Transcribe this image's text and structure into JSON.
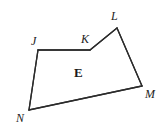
{
  "figure": {
    "name": "polygon-jklmn",
    "width": 165,
    "height": 137,
    "background_color": "#ffffff",
    "stroke_color": "#2b2b2b",
    "stroke_width": 1.3,
    "interior_label": {
      "text": "E",
      "x": 74,
      "y": 66,
      "color": "#1a1a1a"
    },
    "vertices": [
      {
        "id": "J",
        "label": "J",
        "x": 38,
        "y": 50,
        "label_x": 31,
        "label_y": 35
      },
      {
        "id": "K",
        "label": "K",
        "x": 90,
        "y": 50,
        "label_x": 81,
        "label_y": 33
      },
      {
        "id": "L",
        "label": "L",
        "x": 117,
        "y": 28,
        "label_x": 111,
        "label_y": 10
      },
      {
        "id": "M",
        "label": "M",
        "x": 142,
        "y": 86,
        "label_x": 145,
        "label_y": 88
      },
      {
        "id": "N",
        "label": "N",
        "x": 29,
        "y": 110,
        "label_x": 16,
        "label_y": 112
      }
    ],
    "edges": [
      {
        "from": "J",
        "to": "K"
      },
      {
        "from": "K",
        "to": "L"
      },
      {
        "from": "L",
        "to": "M"
      },
      {
        "from": "M",
        "to": "N"
      },
      {
        "from": "N",
        "to": "J"
      }
    ],
    "path": "M 38 50 L 90 50 L 117 28 L 142 86 L 29 110 Z"
  }
}
